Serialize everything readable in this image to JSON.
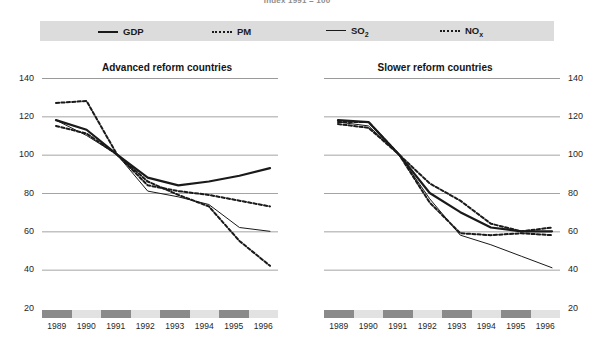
{
  "suptitle": "Index 1991 = 100",
  "legend": {
    "items": [
      {
        "label": "GDP",
        "style": "solid-thick",
        "key": "gdp"
      },
      {
        "label": "PM",
        "style": "dotted",
        "key": "pm"
      },
      {
        "label": "SO",
        "sub": "2",
        "style": "solid-thin",
        "key": "so2"
      },
      {
        "label": "NO",
        "sub": "x",
        "style": "dotted",
        "key": "nox"
      }
    ]
  },
  "axis": {
    "y_ticks": [
      140,
      120,
      100,
      80,
      60,
      40,
      20
    ],
    "y_min": 20,
    "y_max": 140,
    "x_categories": [
      "1989",
      "1990",
      "1991",
      "1992",
      "1993",
      "1994",
      "1995",
      "1996"
    ],
    "band_pattern": [
      "dark",
      "light",
      "dark",
      "light",
      "dark",
      "light",
      "dark",
      "light"
    ]
  },
  "colors": {
    "legend_band": "#dcdcdc",
    "gridline": "#9a9a9a",
    "band_dark": "#8a8a8a",
    "band_light": "#e2e2e2",
    "line": "#1a1a1a"
  },
  "chart_data": [
    {
      "type": "line",
      "title": "Advanced reform countries",
      "xlabel": "",
      "ylabel": "Index 1991 = 100",
      "x": [
        "1989",
        "1990",
        "1991",
        "1992",
        "1993",
        "1994",
        "1995",
        "1996"
      ],
      "ylim": [
        20,
        140
      ],
      "grid": true,
      "legend_position": "top",
      "series": [
        {
          "name": "GDP",
          "style": "solid-thick",
          "values": [
            118,
            113,
            100,
            88,
            84,
            86,
            89,
            93
          ]
        },
        {
          "name": "PM",
          "style": "dotted",
          "values": [
            127,
            128,
            100,
            84,
            81,
            79,
            76,
            73
          ]
        },
        {
          "name": "SO2",
          "style": "solid-thin",
          "values": [
            118,
            110,
            100,
            81,
            78,
            74,
            62,
            60
          ]
        },
        {
          "name": "NOx",
          "style": "dotted",
          "values": [
            115,
            111,
            100,
            86,
            79,
            73,
            55,
            42
          ]
        }
      ]
    },
    {
      "type": "line",
      "title": "Slower reform countries",
      "xlabel": "",
      "ylabel": "Index 1991 = 100",
      "x": [
        "1989",
        "1990",
        "1991",
        "1992",
        "1993",
        "1994",
        "1995",
        "1996"
      ],
      "ylim": [
        20,
        140
      ],
      "grid": true,
      "legend_position": "top",
      "series": [
        {
          "name": "GDP",
          "style": "solid-thick",
          "values": [
            118,
            117,
            100,
            80,
            70,
            62,
            60,
            60
          ]
        },
        {
          "name": "PM",
          "style": "dotted",
          "values": [
            117,
            117,
            100,
            85,
            76,
            64,
            60,
            62
          ]
        },
        {
          "name": "SO2",
          "style": "solid-thin",
          "values": [
            117,
            115,
            100,
            77,
            58,
            53,
            47,
            41
          ]
        },
        {
          "name": "NOx",
          "style": "dotted",
          "values": [
            116,
            114,
            100,
            75,
            59,
            58,
            59,
            58
          ]
        }
      ]
    }
  ]
}
